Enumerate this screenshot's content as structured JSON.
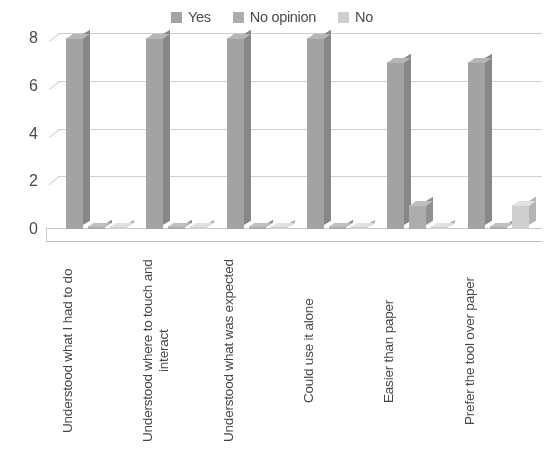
{
  "legend": {
    "position": "top-center",
    "items": [
      {
        "label": "Yes",
        "color": "#a3a3a3",
        "icon": "legend-swatch"
      },
      {
        "label": "No opinion",
        "color": "#adadad",
        "icon": "legend-swatch"
      },
      {
        "label": "No",
        "color": "#cfcfcf",
        "icon": "legend-swatch"
      }
    ]
  },
  "axes": {
    "y_ticks": [
      "0",
      "2",
      "4",
      "6",
      "8"
    ],
    "y_min": 0,
    "y_max": 8,
    "grid": true
  },
  "chart_data": {
    "type": "bar",
    "title": "",
    "subtitle": "",
    "xlabel": "",
    "ylabel": "",
    "ylim": [
      0,
      8
    ],
    "ytick_values": [
      0,
      2,
      4,
      6,
      8
    ],
    "grid": true,
    "legend_position": "top-center",
    "style": "3d-clustered-column",
    "categories": [
      "Understood what I had to do",
      "Understood where to touch and interact",
      "Understood what was expected",
      "Could use it alone",
      "Easier than paper",
      "Prefer the tool over paper"
    ],
    "series": [
      {
        "name": "Yes",
        "color": "#a3a3a3",
        "values": [
          8,
          8,
          8,
          8,
          7,
          7
        ]
      },
      {
        "name": "No opinion",
        "color": "#adadad",
        "values": [
          0,
          0,
          0,
          0,
          1,
          0
        ]
      },
      {
        "name": "No",
        "color": "#cfcfcf",
        "values": [
          0,
          0,
          0,
          0,
          0,
          1
        ]
      }
    ]
  }
}
